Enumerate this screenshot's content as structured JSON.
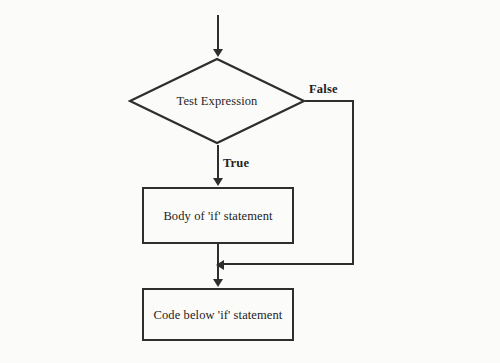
{
  "page": {
    "background_color": "#fbfbfa",
    "ink_color": "#2e2e2e",
    "ghost_text_color": "#d7d7d4"
  },
  "flowchart": {
    "type": "if-statement-flowchart",
    "decision": {
      "label": "Test Expression",
      "shape": "diamond"
    },
    "branches": {
      "true_label": "True",
      "false_label": "False"
    },
    "process_boxes": [
      {
        "id": "body-if",
        "label": "Body of 'if' statement"
      },
      {
        "id": "code-below",
        "label": "Code below 'if' statement"
      }
    ]
  },
  "background_text": {
    "topmid": "                     \n    ",
    "left": "                              \n                              \n                             \n                             \n\n                              \n                             \n                              \n                             \n                              \n                             \n                              \n                             \n                              \n                             \n                              \n                             \n                              \n                             \n                              \n                             \n                              \n                             ",
    "right": "                              \n                             \n                              \n                             \n                              \n                             ",
    "midband": "                              \n                             \n                              \n                             \n                              \n                             \n                              \n                             ",
    "lowerband": "                              \n                             \n                              ",
    "belowband": "                              \n                             \n                              \n                             "
  }
}
